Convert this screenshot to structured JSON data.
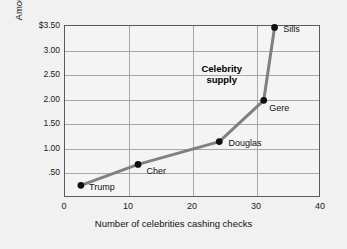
{
  "chart_data": {
    "type": "line",
    "title": "",
    "xlabel": "Number of celebrities cashing checks",
    "ylabel": "Amount of check",
    "xlim": [
      0,
      40
    ],
    "ylim": [
      0,
      3.5
    ],
    "grid": true,
    "legend": "none",
    "xticks": [
      "0",
      "10",
      "20",
      "30",
      "40"
    ],
    "xtick_values": [
      0,
      10,
      20,
      30,
      40
    ],
    "yticks": [
      "$3.50",
      "3.00",
      "2.50",
      "2.00",
      "1.50",
      "1.00",
      ".50"
    ],
    "ytick_values": [
      3.5,
      3.0,
      2.5,
      2.0,
      1.5,
      1.0,
      0.5
    ],
    "series": [
      {
        "name": "Celebrity supply",
        "x": [
          2.5,
          11.5,
          24.3,
          31.3,
          33.0
        ],
        "values": [
          0.22,
          0.65,
          1.12,
          1.97,
          3.47
        ],
        "point_labels": [
          "Trump",
          "Cher",
          "Douglas",
          "Gere",
          "Sills"
        ],
        "line_color": "#808080",
        "marker_color": "#111111"
      }
    ],
    "annotations": [
      {
        "text_line_1": "Celebrity",
        "text_line_2": "supply",
        "x": 26.0,
        "y": 2.55
      }
    ]
  },
  "labels": {
    "points": {
      "trump": "Trump",
      "cher": "Cher",
      "douglas": "Douglas",
      "gere": "Gere",
      "sills": "Sills"
    },
    "annotation_line_1": "Celebrity",
    "annotation_line_2": "supply"
  },
  "axis": {
    "y_title": "Amount of check",
    "x_title": "Number of celebrities cashing checks",
    "y_ticks": {
      "t0": "$3.50",
      "t1": "3.00",
      "t2": "2.50",
      "t3": "2.00",
      "t4": "1.50",
      "t5": "1.00",
      "t6": ".50"
    },
    "x_ticks": {
      "t0": "0",
      "t1": "10",
      "t2": "20",
      "t3": "30",
      "t4": "40"
    }
  },
  "colors": {
    "background": "#f1f1f1",
    "plot_background": "#f4f4f4",
    "gridline": "#a8a8a8",
    "frame": "#5a5a5a",
    "series_line": "#808080",
    "marker": "#111111",
    "text": "#111111"
  }
}
